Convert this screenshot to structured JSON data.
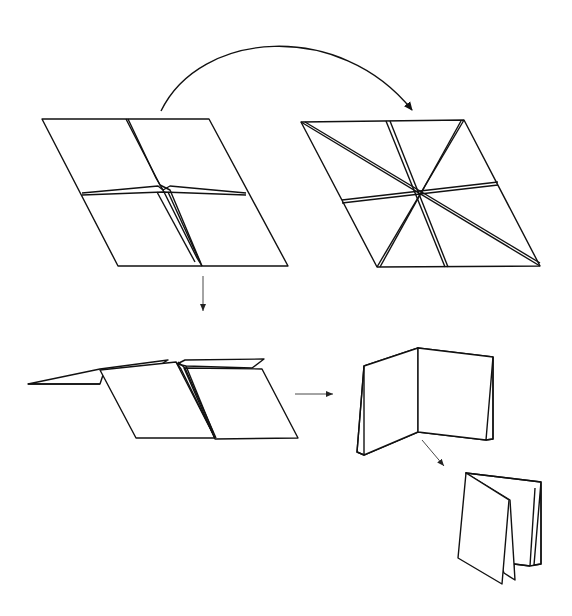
{
  "diagram": {
    "steps": [
      {
        "id": "step-1",
        "label": "Square with valley folds (quarters), pinched center"
      },
      {
        "id": "step-2",
        "label": "Square with eight radial creases meeting at center"
      },
      {
        "id": "step-3",
        "label": "Flaps folded up along center crease"
      },
      {
        "id": "step-4",
        "label": "Open book form"
      },
      {
        "id": "step-5",
        "label": "Closed pleated booklet"
      }
    ],
    "arrows": [
      {
        "id": "arrow-curved",
        "from": "step-1",
        "to": "step-2"
      },
      {
        "id": "arrow-down",
        "from": "step-1",
        "to": "step-3"
      },
      {
        "id": "arrow-right",
        "from": "step-3",
        "to": "step-4"
      },
      {
        "id": "arrow-diag",
        "from": "step-4",
        "to": "step-5"
      }
    ],
    "colors": {
      "line": "#111111",
      "background": "#ffffff"
    }
  }
}
